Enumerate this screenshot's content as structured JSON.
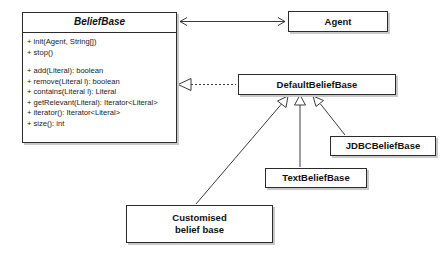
{
  "diagram": {
    "kind": "uml-class-diagram",
    "background_color": "#ffffff",
    "line_color": "#3c3c3c",
    "border_color": "#2b2b2b",
    "shadow_color": "#c9c9c9",
    "text_color": "#111111"
  },
  "classes": {
    "belief_base": {
      "name": "BeliefBase",
      "stereotype": "interface",
      "member_groups": [
        {
          "members": [
            "+ init(Agent, String[])",
            "+ stop()"
          ]
        },
        {
          "members": [
            "+ add(Literal): boolean",
            "+ remove(Literal l): boolean",
            "+ contains(Literal l): Literal",
            "+ getRelevant(Literal): Iterator<Literal>",
            "+ iterator(): Iterator<Literal>",
            "+ size(): int"
          ]
        }
      ]
    },
    "agent": {
      "name": "Agent"
    },
    "default_belief_base": {
      "name": "DefaultBeliefBase"
    },
    "jdbc_belief_base": {
      "name": "JDBCBeliefBase"
    },
    "text_belief_base": {
      "name": "TextBeliefBase"
    },
    "customised_belief_base": {
      "name_line_1": "Customised",
      "name_line_2": "belief base"
    }
  },
  "relationships": [
    {
      "type": "association",
      "from": "BeliefBase",
      "to": "Agent",
      "style": "solid",
      "arrow_start": "open-arrow",
      "arrow_end": "open-arrow"
    },
    {
      "type": "realization",
      "from": "DefaultBeliefBase",
      "to": "BeliefBase",
      "style": "dotted",
      "arrow_end": "hollow-triangle"
    },
    {
      "type": "generalization",
      "from": "JDBCBeliefBase",
      "to": "DefaultBeliefBase",
      "style": "solid",
      "arrow_end": "hollow-triangle"
    },
    {
      "type": "generalization",
      "from": "TextBeliefBase",
      "to": "DefaultBeliefBase",
      "style": "solid",
      "arrow_end": "hollow-triangle"
    },
    {
      "type": "generalization",
      "from": "Customised belief base",
      "to": "DefaultBeliefBase",
      "style": "solid",
      "arrow_end": "hollow-triangle"
    }
  ]
}
